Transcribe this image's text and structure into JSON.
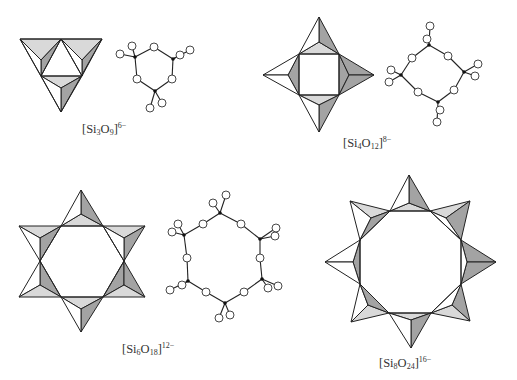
{
  "colors": {
    "light_face": "#d9d9d9",
    "dark_face": "#a3a3a3",
    "line": "#222222",
    "silicon": "#111111",
    "oxygen": "#ffffff"
  },
  "structures": [
    {
      "id": "si3o9",
      "formula": {
        "open": "[Si",
        "n_si": "3",
        "o": "O",
        "n_o": "9",
        "close": "]",
        "charge": "6−"
      },
      "ring_size": 3,
      "views": [
        "polyhedral",
        "ball-and-stick"
      ]
    },
    {
      "id": "si4o12",
      "formula": {
        "open": "[Si",
        "n_si": "4",
        "o": "O",
        "n_o": "12",
        "close": "]",
        "charge": "8−"
      },
      "ring_size": 4,
      "views": [
        "polyhedral",
        "ball-and-stick"
      ]
    },
    {
      "id": "si6o18",
      "formula": {
        "open": "[Si",
        "n_si": "6",
        "o": "O",
        "n_o": "18",
        "close": "]",
        "charge": "12−"
      },
      "ring_size": 6,
      "views": [
        "polyhedral",
        "ball-and-stick"
      ]
    },
    {
      "id": "si8o24",
      "formula": {
        "open": "[Si",
        "n_si": "8",
        "o": "O",
        "n_o": "24",
        "close": "]",
        "charge": "16−"
      },
      "ring_size": 8,
      "views": [
        "polyhedral"
      ]
    }
  ]
}
